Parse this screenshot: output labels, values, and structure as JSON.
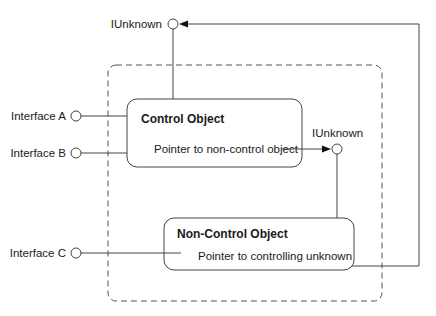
{
  "diagram": {
    "top_iunknown_label": "IUnknown",
    "middle_iunknown_label": "IUnknown",
    "interfaces": [
      {
        "label": "Interface A"
      },
      {
        "label": "Interface B"
      },
      {
        "label": "Interface C"
      }
    ],
    "control_object": {
      "title": "Control Object",
      "pointer_label": "Pointer to non-control object"
    },
    "non_control_object": {
      "title": "Non-Control Object",
      "pointer_label": "Pointer to controlling unknown"
    },
    "colors": {
      "line": "#444444",
      "text": "#1a1a1a",
      "background": "#ffffff"
    }
  }
}
